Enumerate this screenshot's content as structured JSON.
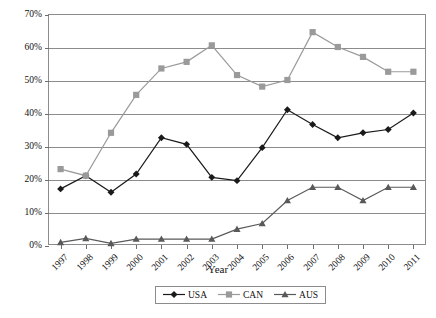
{
  "chart_data": {
    "type": "line",
    "title": "",
    "xlabel": "Year",
    "ylabel": "",
    "categories": [
      "1997",
      "1998",
      "1999",
      "2000",
      "2001",
      "2002",
      "2003",
      "2004",
      "2005",
      "2006",
      "2007",
      "2008",
      "2009",
      "2010",
      "2011"
    ],
    "ylim": [
      0,
      70
    ],
    "ytick_values": [
      0,
      10,
      20,
      30,
      40,
      50,
      60,
      70
    ],
    "ytick_labels": [
      "0%",
      "10%",
      "20%",
      "30%",
      "40%",
      "50%",
      "60%",
      "70%"
    ],
    "grid": true,
    "legend_position": "bottom",
    "series": [
      {
        "name": "USA",
        "marker": "diamond",
        "color": "#1a1a1a",
        "values": [
          17,
          21,
          16,
          21.5,
          32.5,
          30.5,
          20.5,
          19.5,
          29.5,
          41,
          36.5,
          32.5,
          34,
          35,
          40
        ]
      },
      {
        "name": "CAN",
        "marker": "square",
        "color": "#9a9a9a",
        "values": [
          23,
          21,
          34,
          45.5,
          53.5,
          55.5,
          60.5,
          51.5,
          48,
          50,
          64.5,
          60,
          57,
          52.5,
          52.5
        ]
      },
      {
        "name": "AUS",
        "marker": "triangle",
        "color": "#595959",
        "values": [
          0.8,
          2,
          0.5,
          1.8,
          1.8,
          1.8,
          1.8,
          4.8,
          6.5,
          13.5,
          17.5,
          17.5,
          13.5,
          17.5,
          17.5
        ]
      }
    ]
  },
  "legend": {
    "items": [
      {
        "label": "USA"
      },
      {
        "label": "CAN"
      },
      {
        "label": "AUS"
      }
    ]
  },
  "axis": {
    "x_title": "Year"
  }
}
